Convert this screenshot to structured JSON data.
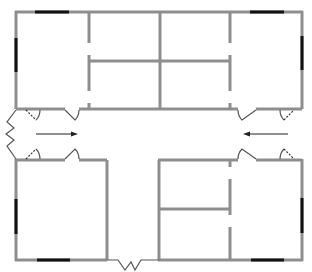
{
  "diagram": {
    "type": "floor-plan",
    "title": "",
    "colors": {
      "wall": "#8e8e8e",
      "window": "#111111",
      "door": "#555555",
      "arrow": "#222222",
      "background": "#ffffff"
    },
    "rooms": [
      {
        "id": "office-top-left",
        "label": ""
      },
      {
        "id": "office-top-center-left-upper",
        "label": ""
      },
      {
        "id": "office-top-center-left-lower",
        "label": ""
      },
      {
        "id": "office-top-center-right-upper",
        "label": ""
      },
      {
        "id": "office-top-center-right-lower",
        "label": ""
      },
      {
        "id": "office-top-right",
        "label": ""
      },
      {
        "id": "office-bottom-left",
        "label": ""
      },
      {
        "id": "office-bottom-center-upper",
        "label": ""
      },
      {
        "id": "office-bottom-center-lower",
        "label": ""
      },
      {
        "id": "office-bottom-right",
        "label": ""
      },
      {
        "id": "main-corridor",
        "label": ""
      },
      {
        "id": "south-corridor",
        "label": ""
      }
    ],
    "entrances": [
      {
        "id": "west-entrance",
        "type": "double-door"
      },
      {
        "id": "east-entrance",
        "type": "double-door"
      },
      {
        "id": "south-entrance",
        "type": "double-door"
      }
    ],
    "arrows": [
      {
        "id": "arrow-west",
        "direction": "right"
      },
      {
        "id": "arrow-east",
        "direction": "left"
      }
    ]
  }
}
